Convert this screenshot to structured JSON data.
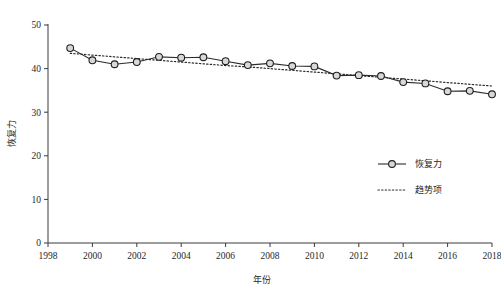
{
  "chart_data": {
    "type": "line",
    "title": "",
    "xlabel": "年份",
    "ylabel": "恢复力",
    "xlim": [
      1998,
      2018
    ],
    "ylim": [
      0,
      50
    ],
    "grid": false,
    "legend_position": "right-middle",
    "x": [
      1999,
      2000,
      2001,
      2002,
      2003,
      2004,
      2005,
      2006,
      2007,
      2008,
      2009,
      2010,
      2011,
      2012,
      2013,
      2014,
      2015,
      2016,
      2017,
      2018
    ],
    "xticks": [
      "1998",
      "2000",
      "2002",
      "2004",
      "2006",
      "2008",
      "2010",
      "2012",
      "2014",
      "2016",
      "2018"
    ],
    "xtick_values": [
      1998,
      2000,
      2002,
      2004,
      2006,
      2008,
      2010,
      2012,
      2014,
      2016,
      2018
    ],
    "yticks": [
      "0",
      "10",
      "20",
      "30",
      "40",
      "50"
    ],
    "ytick_values": [
      0,
      10,
      20,
      30,
      40,
      50
    ],
    "series": [
      {
        "name": "恢复力",
        "style": "solid-with-markers",
        "marker": "circle",
        "marker_fill": "#d8d8d8",
        "marker_edge": "#1f1f1f",
        "color": "#2b2b2b",
        "values": [
          44.7,
          41.9,
          41.0,
          41.5,
          42.7,
          42.5,
          42.6,
          41.7,
          40.8,
          41.2,
          40.6,
          40.5,
          38.4,
          38.5,
          38.3,
          36.9,
          36.6,
          34.8,
          34.9,
          34.1
        ]
      },
      {
        "name": "趋势项",
        "style": "dotted",
        "color": "#2b2b2b",
        "values": [
          43.5,
          43.1,
          42.7,
          42.3,
          41.9,
          41.5,
          41.1,
          40.7,
          40.4,
          40.0,
          39.6,
          39.2,
          38.8,
          38.4,
          38.0,
          37.6,
          37.2,
          36.8,
          36.4,
          36.0
        ]
      }
    ],
    "legend": [
      {
        "label": "恢复力",
        "style": "solid-with-markers"
      },
      {
        "label": "趋势项",
        "style": "dotted"
      }
    ]
  }
}
